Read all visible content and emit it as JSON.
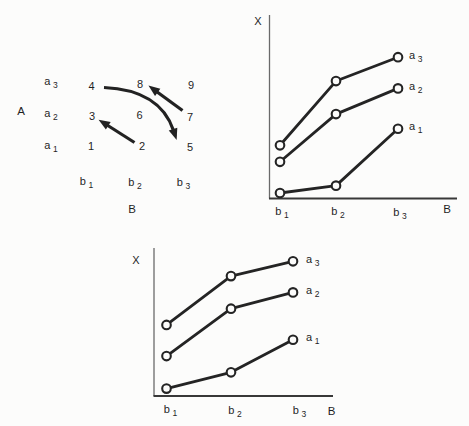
{
  "figure": {
    "background": "#fcfcfb",
    "ink": "#1f1f1f"
  },
  "matrix": {
    "row_axis_label": "A",
    "col_axis_label": "B",
    "row_labels": [
      "a3",
      "a2",
      "a1"
    ],
    "col_labels": [
      "b1",
      "b2",
      "b3"
    ],
    "cells": [
      [
        "4",
        "8",
        "9"
      ],
      [
        "3",
        "6",
        "7"
      ],
      [
        "1",
        "2",
        "5"
      ]
    ],
    "arrows": [
      {
        "name": "arrow-2-to-3",
        "from_cell": "2",
        "to_cell": "3",
        "shape": "straight"
      },
      {
        "name": "arrow-7-to-8",
        "from_cell": "7",
        "to_cell": "8",
        "shape": "straight"
      },
      {
        "name": "arrow-4-to-5",
        "from_cell": "4",
        "to_cell": "5",
        "shape": "curved"
      }
    ]
  },
  "chart_data": [
    {
      "type": "table",
      "title": "A x B design cell numbering",
      "row_labels": [
        "a3",
        "a2",
        "a1"
      ],
      "col_labels": [
        "b1",
        "b2",
        "b3"
      ],
      "rows": [
        [
          4,
          8,
          9
        ],
        [
          3,
          6,
          7
        ],
        [
          1,
          2,
          5
        ]
      ]
    },
    {
      "type": "line",
      "position": "top-right",
      "xlabel": "B",
      "ylabel": "X",
      "categories": [
        "b1",
        "b2",
        "b3"
      ],
      "series": [
        {
          "name": "a3",
          "values": [
            2.9,
            6.4,
            7.7
          ]
        },
        {
          "name": "a2",
          "values": [
            2.0,
            4.6,
            6.0
          ]
        },
        {
          "name": "a1",
          "values": [
            0.3,
            0.7,
            3.8
          ]
        }
      ],
      "ylim": [
        0,
        10
      ],
      "y_unit": "relative (axis unlabeled)",
      "marker": "open-circle",
      "legend": "series labels at right ends of lines",
      "frame": {
        "left": 269,
        "top": 15,
        "bottom": 198.5,
        "right": 457,
        "x_px": [
          280,
          336,
          398
        ],
        "label_left": 409
      }
    },
    {
      "type": "line",
      "position": "bottom-center",
      "xlabel": "B",
      "ylabel": "X",
      "categories": [
        "b1",
        "b2",
        "b3"
      ],
      "series": [
        {
          "name": "a3",
          "values": [
            4.8,
            8.1,
            9.1
          ]
        },
        {
          "name": "a2",
          "values": [
            2.7,
            5.9,
            7.0
          ]
        },
        {
          "name": "a1",
          "values": [
            0.5,
            1.6,
            3.8
          ]
        }
      ],
      "ylim": [
        0,
        10
      ],
      "y_unit": "relative (axis unlabeled)",
      "marker": "open-circle",
      "legend": "series labels at right ends of lines",
      "frame": {
        "left": 154,
        "top": 248,
        "bottom": 396,
        "right": 333,
        "x_px": [
          166.5,
          231,
          293
        ],
        "label_left": 306
      }
    }
  ]
}
